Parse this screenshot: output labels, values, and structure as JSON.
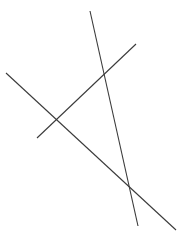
{
  "figure": {
    "width": 180,
    "height": 239,
    "background_color": "#ffffff",
    "stroke_color": "#3a3a3a",
    "stroke_width": 1.1,
    "segments": [
      {
        "name": "descending-line",
        "description": "long line from upper-left to lower-right",
        "x1": 6,
        "y1": 73,
        "x2": 176,
        "y2": 230,
        "color": "#3a3a3a"
      },
      {
        "name": "steep-line",
        "description": "steep line from top-center to bottom-right",
        "x1": 90,
        "y1": 11,
        "x2": 138,
        "y2": 226,
        "color": "#3a3a3a"
      },
      {
        "name": "ascending-line",
        "description": "short line from lower-left to upper-right",
        "x1": 37,
        "y1": 138,
        "x2": 136,
        "y2": 44,
        "color": "#3a3a3a"
      }
    ],
    "intersections": [
      {
        "name": "intersection-upper",
        "x": 105,
        "y": 73
      },
      {
        "name": "intersection-left",
        "x": 52,
        "y": 121
      },
      {
        "name": "intersection-lower",
        "x": 133,
        "y": 195
      }
    ]
  }
}
